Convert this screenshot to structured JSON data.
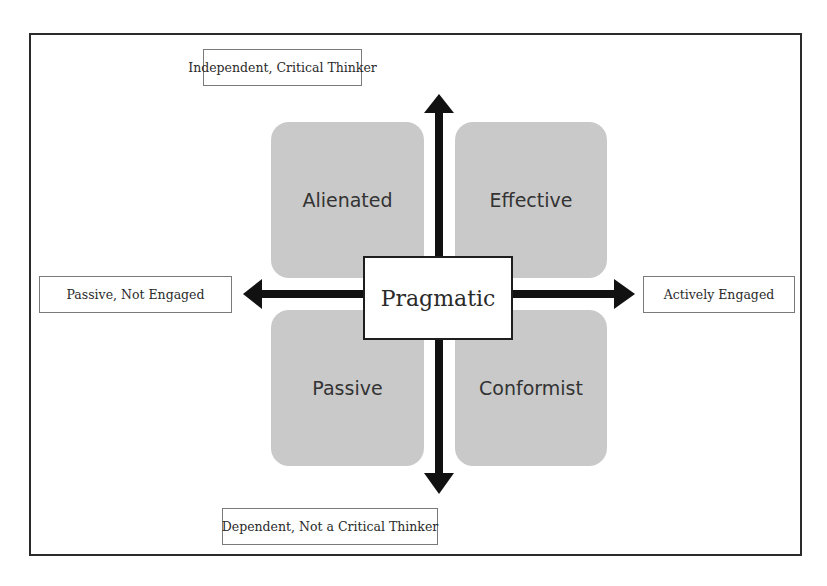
{
  "diagram": {
    "center": {
      "label": "Pragmatic"
    },
    "axes": {
      "top": "Independent, Critical Thinker",
      "bottom": "Dependent, Not a Critical Thinker",
      "left": "Passive, Not Engaged",
      "right": "Actively Engaged"
    },
    "quadrants": {
      "top_left": "Alienated",
      "top_right": "Effective",
      "bottom_left": "Passive",
      "bottom_right": "Conformist"
    },
    "colors": {
      "quadrant_fill": "#c9c9c9",
      "arrow": "#111111",
      "frame": "#2b2b2b"
    }
  }
}
